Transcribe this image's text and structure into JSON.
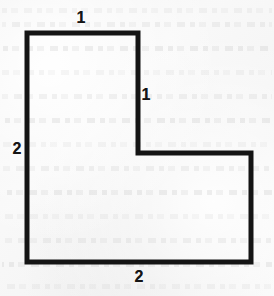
{
  "figure": {
    "name": "l-shaped-polygon-figure",
    "background_color": "#f8f8f8",
    "stroke_color": "#141414",
    "stroke_width": 5,
    "width": 274,
    "height": 296,
    "vertices": [
      {
        "x": 27,
        "y": 33
      },
      {
        "x": 138,
        "y": 33
      },
      {
        "x": 138,
        "y": 153
      },
      {
        "x": 251,
        "y": 153
      },
      {
        "x": 251,
        "y": 262
      },
      {
        "x": 27,
        "y": 262
      }
    ],
    "labels": [
      {
        "id": "top-edge-length",
        "text": "1",
        "x": 81,
        "y": 18
      },
      {
        "id": "inner-vertical-edge-length",
        "text": "1",
        "x": 146,
        "y": 95
      },
      {
        "id": "left-edge-length",
        "text": "2",
        "x": 17,
        "y": 149
      },
      {
        "id": "bottom-edge-length",
        "text": "2",
        "x": 139,
        "y": 277
      }
    ],
    "ghost_text_rows": [
      8,
      22,
      46,
      70,
      94,
      118,
      142,
      166,
      190,
      214,
      238,
      262,
      284
    ]
  },
  "chart_data": {
    "type": "diagram",
    "title": "",
    "shape": "L-shaped hexagon",
    "dimension_labels": [
      "1",
      "1",
      "2",
      "2"
    ],
    "edges": [
      {
        "from": 0,
        "to": 1,
        "orientation": "horizontal",
        "label": "1"
      },
      {
        "from": 1,
        "to": 2,
        "orientation": "vertical",
        "label": "1"
      },
      {
        "from": 2,
        "to": 3,
        "orientation": "horizontal",
        "label": ""
      },
      {
        "from": 3,
        "to": 4,
        "orientation": "vertical",
        "label": ""
      },
      {
        "from": 4,
        "to": 5,
        "orientation": "horizontal",
        "label": "2"
      },
      {
        "from": 5,
        "to": 0,
        "orientation": "vertical",
        "label": "2"
      }
    ]
  }
}
